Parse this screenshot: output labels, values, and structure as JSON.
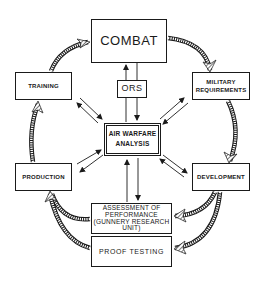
{
  "diagram": {
    "type": "cycle-flow",
    "nodes": {
      "combat": "COMBAT",
      "ors": "ORS",
      "training": "TRAINING",
      "military_requirements_l1": "MILITARY",
      "military_requirements_l2": "REQUIREMENTS",
      "air_warfare_l1": "AIR WARFARE",
      "air_warfare_l2": "ANALYSIS",
      "production": "PRODUCTION",
      "development": "DEVELOPMENT",
      "assessment_l1": "ASSESSMENT OF",
      "assessment_l2": "PERFORMANCE",
      "assessment_l3": "(GUNNERY RESEARCH",
      "assessment_l4": "UNIT)",
      "proof_testing": "PROOF TESTING"
    },
    "cycle_edges": [
      [
        "COMBAT",
        "MILITARY REQUIREMENTS"
      ],
      [
        "MILITARY REQUIREMENTS",
        "DEVELOPMENT"
      ],
      [
        "DEVELOPMENT",
        "ASSESSMENT OF PERFORMANCE (GUNNERY RESEARCH UNIT)"
      ],
      [
        "DEVELOPMENT",
        "PROOF TESTING"
      ],
      [
        "ASSESSMENT OF PERFORMANCE (GUNNERY RESEARCH UNIT)",
        "PRODUCTION"
      ],
      [
        "PROOF TESTING",
        "PRODUCTION"
      ],
      [
        "PRODUCTION",
        "TRAINING"
      ],
      [
        "TRAINING",
        "COMBAT"
      ]
    ],
    "bidirectional_edges": [
      [
        "AIR WARFARE ANALYSIS",
        "TRAINING"
      ],
      [
        "AIR WARFARE ANALYSIS",
        "MILITARY REQUIREMENTS"
      ],
      [
        "AIR WARFARE ANALYSIS",
        "PRODUCTION"
      ],
      [
        "AIR WARFARE ANALYSIS",
        "DEVELOPMENT"
      ],
      [
        "AIR WARFARE ANALYSIS",
        "ASSESSMENT OF PERFORMANCE (GUNNERY RESEARCH UNIT)"
      ],
      [
        "AIR WARFARE ANALYSIS",
        "COMBAT via ORS"
      ]
    ],
    "colors": {
      "ink": "#1a1a1a",
      "background": "#ffffff"
    }
  }
}
